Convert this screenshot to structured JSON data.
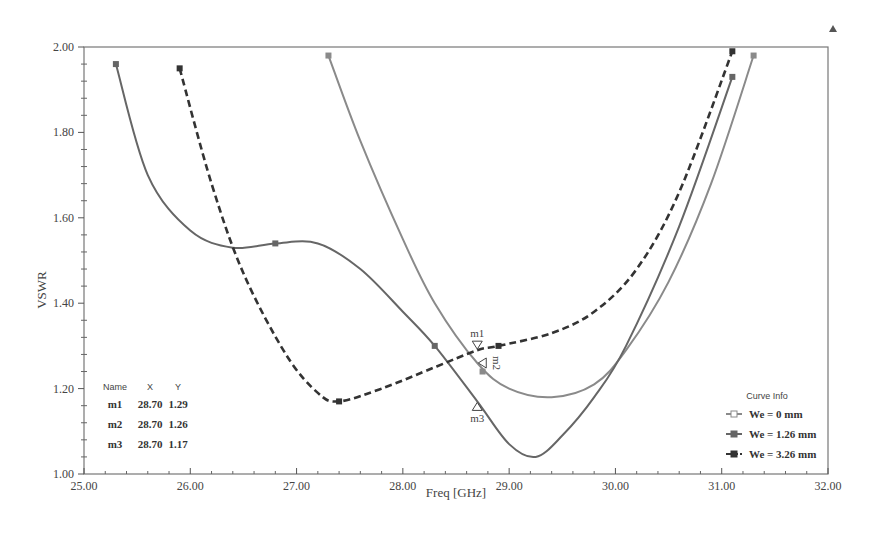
{
  "chart_data": {
    "type": "line",
    "title": "",
    "xlabel": "Freq [GHz]",
    "ylabel": "VSWR",
    "xlim": [
      25.0,
      32.0
    ],
    "ylim": [
      1.0,
      2.0
    ],
    "x_ticks": [
      "25.00",
      "26.00",
      "27.00",
      "28.00",
      "29.00",
      "30.00",
      "31.00",
      "32.00"
    ],
    "y_ticks": [
      "1.00",
      "1.20",
      "1.40",
      "1.60",
      "1.80",
      "2.00"
    ],
    "grid": false,
    "legend_title": "Curve Info",
    "legend_position": "lower right",
    "series": [
      {
        "name": "We = 0 mm",
        "style": "solid",
        "color": "#8a8a8a",
        "points": [
          [
            27.3,
            1.98
          ],
          [
            27.6,
            1.78
          ],
          [
            28.0,
            1.55
          ],
          [
            28.3,
            1.4
          ],
          [
            28.7,
            1.26
          ],
          [
            29.0,
            1.2
          ],
          [
            29.4,
            1.18
          ],
          [
            29.8,
            1.21
          ],
          [
            30.1,
            1.29
          ],
          [
            30.5,
            1.45
          ],
          [
            30.9,
            1.68
          ],
          [
            31.3,
            1.98
          ]
        ]
      },
      {
        "name": "We = 1.26 mm",
        "style": "solid",
        "color": "#666666",
        "points": [
          [
            25.3,
            1.96
          ],
          [
            25.6,
            1.7
          ],
          [
            26.0,
            1.57
          ],
          [
            26.4,
            1.53
          ],
          [
            26.8,
            1.54
          ],
          [
            27.2,
            1.54
          ],
          [
            27.6,
            1.48
          ],
          [
            28.0,
            1.38
          ],
          [
            28.3,
            1.3
          ],
          [
            28.7,
            1.17
          ],
          [
            29.0,
            1.07
          ],
          [
            29.25,
            1.04
          ],
          [
            29.5,
            1.09
          ],
          [
            29.8,
            1.18
          ],
          [
            30.1,
            1.3
          ],
          [
            30.6,
            1.58
          ],
          [
            31.1,
            1.93
          ]
        ]
      },
      {
        "name": "We = 3.26 mm",
        "style": "dashed",
        "color": "#333333",
        "points": [
          [
            25.9,
            1.95
          ],
          [
            26.2,
            1.68
          ],
          [
            26.5,
            1.47
          ],
          [
            26.9,
            1.28
          ],
          [
            27.2,
            1.19
          ],
          [
            27.4,
            1.17
          ],
          [
            27.8,
            1.2
          ],
          [
            28.3,
            1.25
          ],
          [
            28.7,
            1.29
          ],
          [
            28.9,
            1.3
          ],
          [
            29.4,
            1.33
          ],
          [
            29.8,
            1.38
          ],
          [
            30.2,
            1.48
          ],
          [
            30.6,
            1.66
          ],
          [
            31.1,
            1.99
          ]
        ]
      }
    ],
    "markers": [
      {
        "name": "m1",
        "x": 28.7,
        "y": 1.29
      },
      {
        "name": "m2",
        "x": 28.7,
        "y": 1.26
      },
      {
        "name": "m3",
        "x": 28.7,
        "y": 1.17
      }
    ]
  },
  "marker_table": {
    "headers": [
      "Name",
      "X",
      "Y"
    ],
    "rows": [
      [
        "m1",
        "28.70",
        "1.29"
      ],
      [
        "m2",
        "28.70",
        "1.26"
      ],
      [
        "m3",
        "28.70",
        "1.17"
      ]
    ]
  },
  "legend": {
    "title": "Curve Info",
    "items": [
      "We = 0 mm",
      "We = 1.26 mm",
      "We = 3.26 mm"
    ]
  }
}
